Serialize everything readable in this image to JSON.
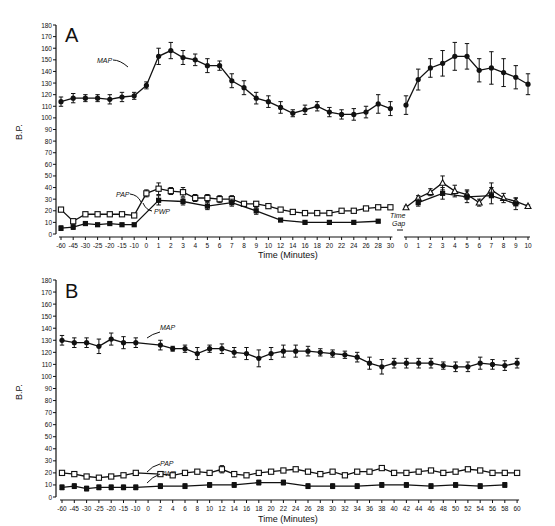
{
  "chart_data": [
    {
      "panel": "A",
      "type": "line",
      "title": "A",
      "xlabel": "Time (Minutes)",
      "ylabel": "B.P.",
      "ylim": [
        0,
        180
      ],
      "yticks": [
        0,
        10,
        20,
        30,
        40,
        50,
        60,
        70,
        80,
        90,
        100,
        110,
        120,
        130,
        140,
        150,
        160,
        170,
        180
      ],
      "grid": false,
      "annotations": [
        "MAP",
        "PAP",
        "PWP",
        "Time Gap"
      ],
      "segments": [
        {
          "x": [
            "-60",
            "-45",
            "-30",
            "-25",
            "-20",
            "-15",
            "-10",
            "0",
            "1",
            "2",
            "3",
            "4",
            "5",
            "6",
            "7",
            "8",
            "9",
            "10",
            "12",
            "14",
            "16",
            "18",
            "20",
            "22",
            "24",
            "26",
            "28",
            "30"
          ],
          "series": [
            {
              "name": "MAP",
              "marker": "filled-circle",
              "values": [
                114,
                117,
                117,
                117,
                116,
                118,
                119,
                128,
                153,
                158,
                152,
                150,
                145,
                145,
                132,
                126,
                117,
                114,
                109,
                104,
                107,
                110,
                105,
                103,
                103,
                105,
                112,
                108
              ],
              "errors": [
                4,
                4,
                3,
                3,
                4,
                4,
                3,
                3,
                7,
                7,
                6,
                5,
                6,
                4,
                6,
                6,
                5,
                5,
                5,
                3,
                4,
                4,
                4,
                4,
                5,
                5,
                8,
                6
              ]
            },
            {
              "name": "PAP",
              "marker": "open-square",
              "values": [
                21,
                11,
                17,
                17,
                17,
                17,
                16,
                35,
                39,
                37,
                36,
                31,
                31,
                30,
                30,
                26,
                26,
                24,
                21,
                19,
                18,
                18,
                18,
                20,
                20,
                22,
                23,
                23
              ],
              "errors": [
                1,
                1,
                1,
                1,
                1,
                1,
                1,
                3,
                5,
                3,
                4,
                3,
                3,
                3,
                3,
                2,
                2,
                2,
                1,
                1,
                1,
                1,
                1,
                1,
                1,
                1,
                1,
                1
              ]
            },
            {
              "name": "PWP",
              "marker": "filled-square",
              "values": [
                5,
                6,
                9,
                8,
                9,
                8,
                8,
                null,
                29,
                null,
                28,
                null,
                24,
                null,
                27,
                null,
                20,
                null,
                12,
                null,
                10,
                null,
                10,
                null,
                10,
                null,
                11,
                null
              ],
              "errors": [
                2,
                2,
                1,
                1,
                1,
                1,
                1,
                null,
                4,
                null,
                3,
                null,
                3,
                null,
                3,
                null,
                3,
                null,
                1,
                null,
                1,
                null,
                1,
                null,
                1,
                null,
                1,
                null
              ]
            }
          ]
        },
        {
          "x": [
            "0",
            "1",
            "2",
            "3",
            "4",
            "5",
            "6",
            "7",
            "8",
            "9",
            "10"
          ],
          "series": [
            {
              "name": "MAP",
              "marker": "filled-circle",
              "values": [
                111,
                133,
                143,
                147,
                153,
                153,
                141,
                143,
                139,
                135,
                129
              ],
              "errors": [
                8,
                9,
                8,
                11,
                12,
                11,
                10,
                14,
                12,
                10,
                9
              ]
            },
            {
              "name": "PAP",
              "marker": "open-triangle",
              "values": [
                23,
                31,
                36,
                44,
                37,
                34,
                27,
                38,
                31,
                28,
                24
              ],
              "errors": [
                1,
                2,
                3,
                6,
                5,
                4,
                3,
                6,
                4,
                3,
                1
              ]
            },
            {
              "name": "PWP",
              "marker": "filled-square",
              "values": [
                null,
                27,
                null,
                35,
                null,
                32,
                null,
                33,
                null,
                26,
                null
              ],
              "errors": [
                null,
                3,
                null,
                5,
                null,
                5,
                null,
                7,
                null,
                5,
                null
              ]
            }
          ]
        }
      ]
    },
    {
      "panel": "B",
      "type": "line",
      "title": "B",
      "xlabel": "Time (Minutes)",
      "ylabel": "B.P.",
      "ylim": [
        0,
        180
      ],
      "yticks": [
        0,
        10,
        20,
        30,
        40,
        50,
        60,
        70,
        80,
        90,
        100,
        110,
        120,
        130,
        140,
        150,
        160,
        170,
        180
      ],
      "grid": false,
      "annotations": [
        "MAP",
        "PAP",
        "PWP"
      ],
      "x": [
        "-60",
        "-45",
        "-30",
        "-25",
        "-20",
        "-15",
        "-10",
        "0",
        "2",
        "4",
        "6",
        "8",
        "10",
        "12",
        "14",
        "16",
        "18",
        "20",
        "22",
        "24",
        "26",
        "28",
        "30",
        "32",
        "34",
        "36",
        "38",
        "40",
        "42",
        "44",
        "46",
        "48",
        "50",
        "52",
        "54",
        "56",
        "58",
        "60"
      ],
      "series": [
        {
          "name": "MAP",
          "marker": "filled-circle",
          "values": [
            130,
            128,
            128,
            125,
            131,
            128,
            128,
            null,
            126,
            123,
            123,
            119,
            123,
            123,
            120,
            119,
            115,
            119,
            121,
            121,
            121,
            120,
            119,
            118,
            116,
            111,
            108,
            111,
            111,
            111,
            111,
            109,
            108,
            108,
            111,
            110,
            109,
            111
          ],
          "errors": [
            4,
            4,
            4,
            6,
            5,
            5,
            4,
            null,
            4,
            2,
            3,
            5,
            3,
            4,
            4,
            5,
            7,
            5,
            5,
            5,
            4,
            3,
            3,
            3,
            4,
            5,
            6,
            4,
            4,
            4,
            4,
            3,
            4,
            4,
            5,
            4,
            4,
            4
          ]
        },
        {
          "name": "PAP",
          "marker": "open-square",
          "values": [
            20,
            19,
            17,
            16,
            17,
            18,
            20,
            null,
            19,
            18,
            20,
            21,
            20,
            23,
            19,
            18,
            20,
            21,
            22,
            23,
            21,
            19,
            21,
            18,
            21,
            21,
            24,
            20,
            20,
            21,
            22,
            20,
            21,
            23,
            22,
            20,
            20,
            20
          ],
          "errors": [
            1,
            1,
            1,
            1,
            1,
            1,
            1,
            null,
            1,
            1,
            1,
            1,
            1,
            3,
            1,
            1,
            1,
            1,
            1,
            1,
            1,
            1,
            1,
            1,
            1,
            1,
            1,
            1,
            1,
            1,
            1,
            1,
            1,
            1,
            1,
            1,
            1,
            1
          ]
        },
        {
          "name": "PWP",
          "marker": "filled-square",
          "values": [
            8,
            9,
            7,
            8,
            8,
            8,
            8,
            null,
            9,
            null,
            9,
            null,
            10,
            null,
            10,
            null,
            12,
            null,
            12,
            null,
            9,
            null,
            9,
            null,
            9,
            null,
            10,
            null,
            10,
            null,
            9,
            null,
            10,
            null,
            9,
            null,
            10,
            null
          ],
          "errors": [
            2,
            2,
            2,
            2,
            2,
            2,
            2,
            null,
            2,
            null,
            2,
            null,
            2,
            null,
            2,
            null,
            2,
            null,
            2,
            null,
            2,
            null,
            2,
            null,
            2,
            null,
            2,
            null,
            2,
            null,
            2,
            null,
            2,
            null,
            2,
            null,
            2,
            null
          ]
        }
      ]
    }
  ],
  "labels": {
    "panel_a": "A",
    "panel_b": "B",
    "ylabel": "B.P.",
    "xlabel": "Time (Minutes)",
    "map": "MAP",
    "pap": "PAP",
    "pwp": "PWP",
    "time_gap_1": "Time",
    "time_gap_2": "Gap"
  }
}
